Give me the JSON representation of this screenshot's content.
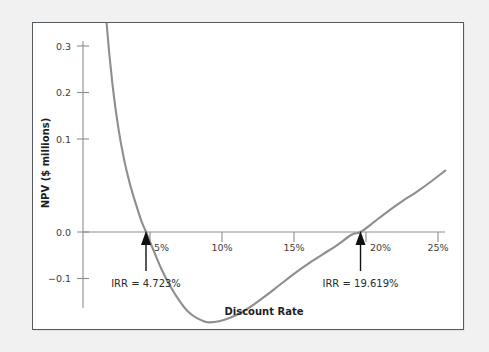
{
  "figure": {
    "background_color": "#f1f1f1",
    "panel_background": "#ffffff",
    "panel_border_color": "#555a5e"
  },
  "chart_data": {
    "type": "line",
    "title": "",
    "subtitle": "",
    "xlabel": "Discount Rate",
    "ylabel": "NPV ($ millions)",
    "xlim": [
      0,
      27
    ],
    "ylim": [
      -0.12,
      0.33
    ],
    "grid": false,
    "legend": null,
    "curve_color": "#8e8e8e",
    "axis_color": "#8e8e8e",
    "x_ticks": [
      5,
      10,
      15,
      20,
      25
    ],
    "x_tick_labels": [
      "5%",
      "10%",
      "15%",
      "20%",
      "25%"
    ],
    "y_ticks": [
      -0.1,
      0.0,
      0.1,
      0.2,
      0.3
    ],
    "y_tick_labels": [
      "−0.1",
      "0.0",
      "0.1",
      "0.2",
      "0.3"
    ],
    "series": [
      {
        "name": "NPV",
        "x": [
          1.6,
          2.0,
          2.4,
          2.8,
          3.2,
          3.6,
          4.0,
          4.4,
          4.723,
          5.2,
          5.8,
          6.4,
          7.0,
          7.6,
          8.2,
          9.0,
          9.8,
          10.6,
          11.4,
          12.2,
          13.0,
          14.0,
          15.0,
          16.0,
          17.0,
          18.0,
          19.0,
          19.619,
          20.5,
          21.5,
          22.5,
          23.5,
          24.5,
          25.5
        ],
        "y": [
          0.313,
          0.222,
          0.158,
          0.112,
          0.078,
          0.052,
          0.031,
          0.012,
          0.0,
          -0.018,
          -0.04,
          -0.058,
          -0.073,
          -0.085,
          -0.092,
          -0.097,
          -0.096,
          -0.092,
          -0.086,
          -0.078,
          -0.069,
          -0.057,
          -0.045,
          -0.034,
          -0.024,
          -0.014,
          -0.003,
          0.0,
          0.01,
          0.022,
          0.033,
          0.043,
          0.054,
          0.066
        ]
      }
    ],
    "annotations": [
      {
        "name": "irr-low",
        "label": "IRR = 4.723%",
        "x_value": 4.723,
        "y_value": 0.0,
        "marker": "up-arrow"
      },
      {
        "name": "irr-high",
        "label": "IRR = 19.619%",
        "x_value": 19.619,
        "y_value": 0.0,
        "marker": "up-arrow"
      }
    ]
  }
}
